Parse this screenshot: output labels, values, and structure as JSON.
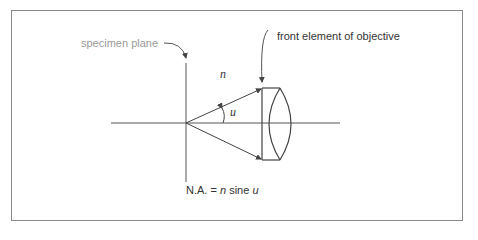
{
  "diagram": {
    "labels": {
      "specimen_plane": "specimen plane",
      "front_element": "front element of objective",
      "refractive_index": "n",
      "half_angle": "u"
    },
    "formula": {
      "lhs": "N.A. =",
      "n": "n",
      "sine": "sine",
      "u": "u"
    },
    "colors": {
      "line": "#444444",
      "frame": "#8a8a8a",
      "specimen_label": "#9a9a9a",
      "text": "#333333"
    }
  }
}
